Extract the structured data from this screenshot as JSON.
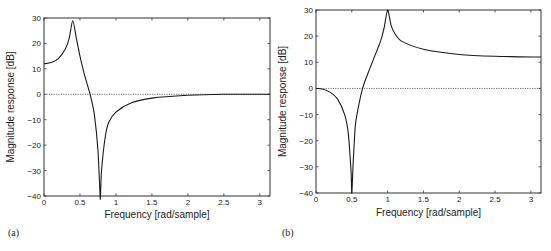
{
  "chart_data": [
    {
      "type": "line",
      "panel_label": "(a)",
      "title": "",
      "xlabel": "Frequency [rad/sample]",
      "ylabel": "Magnitude response [dB]",
      "xlim": [
        0,
        3.1416
      ],
      "ylim": [
        -40,
        30
      ],
      "xticks": [
        "0",
        "0.5",
        "1",
        "1.5",
        "2",
        "2.5",
        "3"
      ],
      "yticks": [
        "30",
        "20",
        "10",
        "0",
        "-10",
        "-20",
        "-30",
        "-40"
      ],
      "grid": false,
      "reference_line": {
        "y": 0,
        "style": "dotted"
      },
      "series": [
        {
          "name": "magnitude",
          "x": [
            0,
            0.1,
            0.2,
            0.3,
            0.35,
            0.4,
            0.45,
            0.5,
            0.55,
            0.6,
            0.65,
            0.7,
            0.75,
            0.78,
            0.785,
            0.8,
            0.85,
            0.9,
            1.0,
            1.2,
            1.5,
            2.0,
            2.5,
            3.1416
          ],
          "y": [
            12,
            12.5,
            14,
            18,
            22,
            29,
            22,
            15,
            9,
            4,
            -1,
            -8,
            -22,
            -40,
            -40,
            -30,
            -17,
            -11,
            -7,
            -3.5,
            -1.5,
            -0.4,
            0,
            0
          ]
        }
      ]
    },
    {
      "type": "line",
      "panel_label": "(b)",
      "title": "",
      "xlabel": "Frequency [rad/sample]",
      "ylabel": "Magnitude response [dB]",
      "xlim": [
        0,
        3.1416
      ],
      "ylim": [
        -40,
        30
      ],
      "xticks": [
        "0",
        "0.5",
        "1",
        "1.5",
        "2",
        "2.5",
        "3"
      ],
      "yticks": [
        "30",
        "20",
        "10",
        "0",
        "-10",
        "-20",
        "-30",
        "-40"
      ],
      "grid": false,
      "reference_line": {
        "y": 0,
        "style": "dotted"
      },
      "series": [
        {
          "name": "magnitude",
          "x": [
            0,
            0.1,
            0.2,
            0.3,
            0.4,
            0.45,
            0.49,
            0.5,
            0.52,
            0.55,
            0.6,
            0.65,
            0.7,
            0.8,
            0.9,
            0.95,
            1.0,
            1.05,
            1.1,
            1.2,
            1.5,
            2.0,
            2.5,
            3.1416
          ],
          "y": [
            0,
            -0.3,
            -1.5,
            -4,
            -10,
            -17,
            -32,
            -40,
            -28,
            -14,
            -6,
            0,
            4,
            11,
            18,
            23,
            30,
            24,
            21,
            18,
            15,
            13,
            12.3,
            12
          ]
        }
      ]
    }
  ]
}
